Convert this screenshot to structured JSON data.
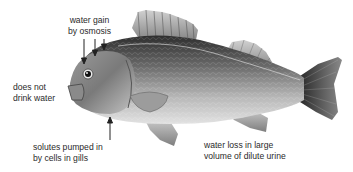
{
  "diagram": {
    "labels": {
      "water_gain": {
        "line1": "water gain",
        "line2": "by osmosis"
      },
      "no_drink": {
        "line1": "does not",
        "line2": "drink water"
      },
      "solutes": {
        "line1": "solutes pumped in",
        "line2": "by cells in gills"
      },
      "water_loss": {
        "line1": "water loss in large",
        "line2": "volume of dilute urine"
      }
    },
    "arrows": [
      {
        "label": "water_gain",
        "direction": "down",
        "count": 3
      },
      {
        "label": "solutes",
        "direction": "up",
        "count": 1
      }
    ],
    "colors": {
      "background": "#ffffff",
      "text": "#2a2a2a",
      "fish_dark": "#3a3a3a",
      "fish_light": "#d8d8d8"
    }
  }
}
